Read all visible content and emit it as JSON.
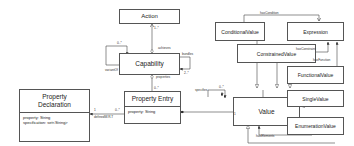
{
  "classes": {
    "action": {
      "name": "Action"
    },
    "capability": {
      "name": "Capability"
    },
    "property_entry": {
      "name": "Property Entry",
      "attributes": [
        "property: String"
      ]
    },
    "property_declaration": {
      "name_line1": "Property",
      "name_line2": "Declaration",
      "attributes": [
        "property: String",
        "specification: set<String>"
      ]
    },
    "value": {
      "name": "Value"
    },
    "conditional_value": {
      "name": "ConditionalValue"
    },
    "constrained_value": {
      "name": "ConstrainedValue"
    },
    "expression": {
      "name": "Expression"
    },
    "functional_value": {
      "name": "FunctionalValue"
    },
    "single_value": {
      "name": "SingleValue"
    },
    "enumeration_value": {
      "name": "EnumerationValue"
    }
  },
  "associations": {
    "achieves": {
      "label": "achieves",
      "multiplicity": "1..*"
    },
    "variant_of": {
      "label": "variantOf",
      "multiplicity": "0..*"
    },
    "bundles": {
      "label": "bundles",
      "multiplicity": "2..*"
    },
    "properties": {
      "label": "properties",
      "multiplicity": "0..*"
    },
    "defined_wrt": {
      "label": "definedW.R.T",
      "multiplicity_source": "1",
      "multiplicity_target": "0..*"
    },
    "specifies": {
      "label": "specifies",
      "multiplicity": "0..*",
      "multiplicity_end": "1"
    },
    "has_condition": {
      "label": "hasCondition"
    },
    "has_constraint": {
      "label": "hasConstraint"
    },
    "has_function": {
      "label": "hasFunction"
    },
    "has_elements": {
      "label": "hasElements"
    }
  }
}
